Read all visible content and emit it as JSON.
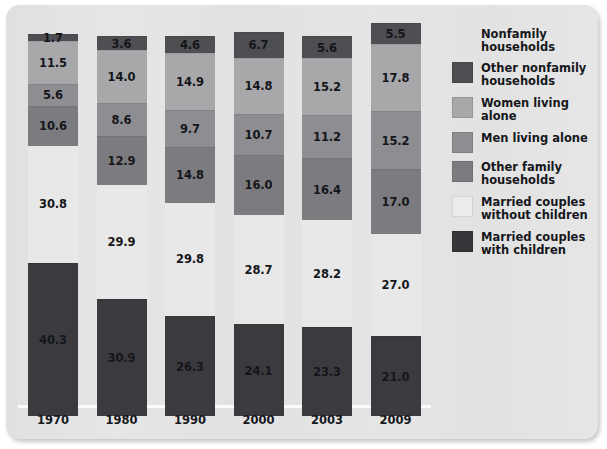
{
  "chart_data": {
    "type": "bar",
    "subtype": "stacked-bar-100",
    "title": "",
    "subtitle": "",
    "xlabel": "",
    "ylabel": "",
    "ylim": [
      0,
      100
    ],
    "grid": false,
    "legend_position": "right",
    "categories": [
      "1970",
      "1980",
      "1990",
      "2000",
      "2003",
      "2009"
    ],
    "series": [
      {
        "name": "Married couples with children",
        "color": "#3b3b3f",
        "values": [
          40.3,
          30.9,
          26.3,
          24.1,
          23.3,
          21.0
        ]
      },
      {
        "name": "Married couples without children",
        "color": "#e8e8e8",
        "values": [
          30.8,
          29.9,
          29.8,
          28.7,
          28.2,
          27.0
        ]
      },
      {
        "name": "Other family households",
        "color": "#7c7c80",
        "values": [
          10.6,
          12.9,
          14.8,
          16.0,
          16.4,
          17.0
        ]
      },
      {
        "name": "Men living alone",
        "color": "#8e8e92",
        "values": [
          5.6,
          8.6,
          9.7,
          10.7,
          11.2,
          15.2
        ]
      },
      {
        "name": "Women living alone",
        "color": "#a8a8ab",
        "values": [
          11.5,
          14.0,
          14.9,
          14.8,
          15.2,
          17.8
        ]
      },
      {
        "name": "Other nonfamily households",
        "color": "#4e4e53",
        "values": [
          1.7,
          3.6,
          4.6,
          6.7,
          5.6,
          5.5
        ]
      }
    ]
  },
  "legend": {
    "items": [
      {
        "label": "Nonfamily households",
        "color": null,
        "is_header": true
      },
      {
        "label": "Other nonfamily households",
        "color": "#4e4e53",
        "is_header": false
      },
      {
        "label": "Women living alone",
        "color": "#a8a8ab",
        "is_header": false
      },
      {
        "label": "Men living alone",
        "color": "#8e8e92",
        "is_header": false
      },
      {
        "label": "Other family households",
        "color": "#7c7c80",
        "is_header": false
      },
      {
        "label": "Married couples without children",
        "color": "#ececec",
        "is_header": false
      },
      {
        "label": "Married couples with children",
        "color": "#35353a",
        "is_header": false
      }
    ]
  },
  "axis": {
    "year_labels": [
      "1970",
      "1980",
      "1990",
      "2000",
      "2003",
      "2009"
    ]
  },
  "colors": {
    "card_background": "#e3e3e3",
    "axis_line": "#fbfbfb",
    "value_text": "#14161a"
  }
}
